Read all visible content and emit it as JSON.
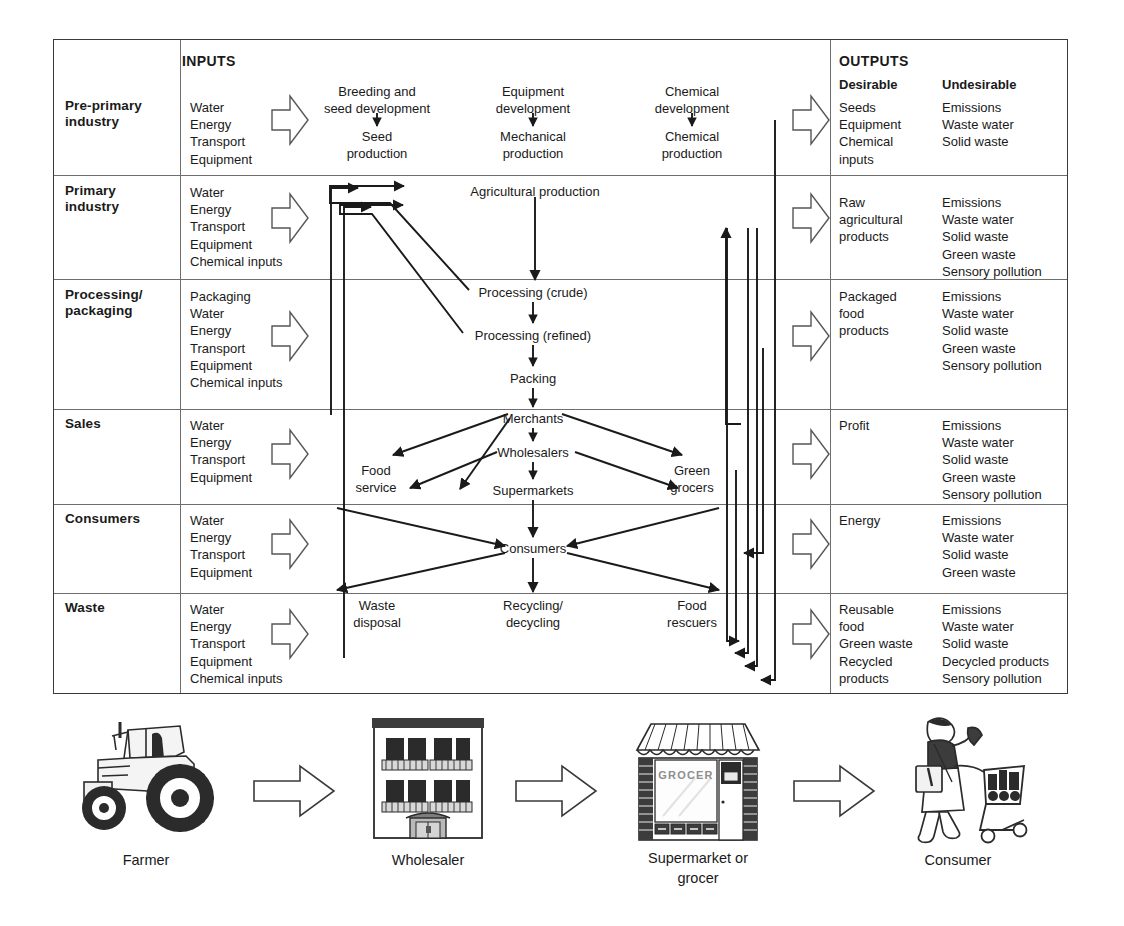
{
  "matrix": {
    "headers": {
      "inputs": "INPUTS",
      "outputs": "OUTPUTS",
      "desirable": "Desirable",
      "undesirable": "Undesirable"
    },
    "rows": [
      {
        "label": "Pre-primary\nindustry",
        "label_lines": [
          "Pre-primary",
          "industry"
        ],
        "inputs": [
          "Water",
          "Energy",
          "Transport",
          "Equipment"
        ],
        "desirable": [
          "Seeds",
          "Equipment",
          "Chemical",
          "inputs"
        ],
        "undesirable": [
          "Emissions",
          "Waste water",
          "Solid waste"
        ],
        "nodes": [
          {
            "lines": [
              "Breeding and",
              "seed development"
            ]
          },
          {
            "lines": [
              "Seed",
              "production"
            ]
          },
          {
            "lines": [
              "Equipment",
              "development"
            ]
          },
          {
            "lines": [
              "Mechanical",
              "production"
            ]
          },
          {
            "lines": [
              "Chemical",
              "development"
            ]
          },
          {
            "lines": [
              "Chemical",
              "production"
            ]
          }
        ]
      },
      {
        "label_lines": [
          "Primary",
          "industry"
        ],
        "inputs": [
          "Water",
          "Energy",
          "Transport",
          "Equipment",
          "Chemical inputs"
        ],
        "desirable": [
          "Raw",
          "agricultural",
          "products"
        ],
        "undesirable": [
          "Emissions",
          "Waste water",
          "Solid waste",
          "Green waste",
          "Sensory pollution"
        ],
        "nodes": [
          {
            "lines": [
              "Agricultural production"
            ]
          }
        ]
      },
      {
        "label_lines": [
          "Processing/",
          "packaging"
        ],
        "inputs": [
          "Packaging",
          "Water",
          "Energy",
          "Transport",
          "Equipment",
          "Chemical inputs"
        ],
        "desirable": [
          "Packaged",
          "food",
          "products"
        ],
        "undesirable": [
          "Emissions",
          "Waste water",
          "Solid waste",
          "Green waste",
          "Sensory pollution"
        ],
        "nodes": [
          {
            "lines": [
              "Processing (crude)"
            ]
          },
          {
            "lines": [
              "Processing (refined)"
            ]
          },
          {
            "lines": [
              "Packing"
            ]
          }
        ]
      },
      {
        "label_lines": [
          "Sales"
        ],
        "inputs": [
          "Water",
          "Energy",
          "Transport",
          "Equipment"
        ],
        "desirable": [
          "Profit"
        ],
        "undesirable": [
          "Emissions",
          "Waste water",
          "Solid waste",
          "Green waste",
          "Sensory pollution"
        ],
        "nodes": [
          {
            "lines": [
              "Merchants"
            ]
          },
          {
            "lines": [
              "Wholesalers"
            ]
          },
          {
            "lines": [
              "Food",
              "service"
            ]
          },
          {
            "lines": [
              "Supermarkets"
            ]
          },
          {
            "lines": [
              "Green",
              "grocers"
            ]
          }
        ]
      },
      {
        "label_lines": [
          "Consumers"
        ],
        "inputs": [
          "Water",
          "Energy",
          "Transport",
          "Equipment"
        ],
        "desirable": [
          "Energy"
        ],
        "undesirable": [
          "Emissions",
          "Waste water",
          "Solid waste",
          "Green waste"
        ],
        "nodes": [
          {
            "lines": [
              "Consumers"
            ]
          }
        ]
      },
      {
        "label_lines": [
          "Waste"
        ],
        "inputs": [
          "Water",
          "Energy",
          "Transport",
          "Equipment",
          "Chemical inputs"
        ],
        "desirable": [
          "Reusable",
          "food",
          "Green waste",
          "Recycled",
          "products"
        ],
        "undesirable": [
          "Emissions",
          "Waste water",
          "Solid waste",
          "Decycled products",
          "Sensory pollution"
        ],
        "nodes": [
          {
            "lines": [
              "Waste",
              "disposal"
            ]
          },
          {
            "lines": [
              "Recycling/",
              "decycling"
            ]
          },
          {
            "lines": [
              "Food",
              "rescuers"
            ]
          }
        ]
      }
    ]
  },
  "chain": {
    "stages": [
      {
        "icon": "tractor-icon",
        "caption_lines": [
          "Farmer"
        ]
      },
      {
        "icon": "warehouse-icon",
        "caption_lines": [
          "Wholesaler"
        ]
      },
      {
        "icon": "grocer-shop-icon",
        "caption_lines": [
          "Supermarket or",
          "grocer"
        ],
        "sign": "GROCER"
      },
      {
        "icon": "shopper-icon",
        "caption_lines": [
          "Consumer"
        ]
      }
    ],
    "arrows": [
      "right-arrow-icon",
      "right-arrow-icon",
      "right-arrow-icon"
    ]
  },
  "colors": {
    "ink": "#1a1a1a",
    "grid": "#6e6e6e",
    "border": "#3a3a3a",
    "chevron_stroke": "#555555",
    "illustration_dark": "#3c3c3c"
  }
}
